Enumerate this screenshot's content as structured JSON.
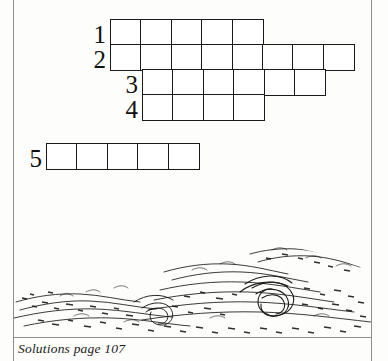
{
  "page": {
    "background_color": "#fdfdfb",
    "rule_color": "#8e8e8e",
    "ink_color": "#1a1a1a"
  },
  "puzzle": {
    "name": "staircase-crossword-grid",
    "cell_width": 32,
    "cell_height": 27,
    "rows": [
      {
        "number": "1",
        "cells": 5,
        "left": 110,
        "top": 19,
        "num_left": 82,
        "num_top": 22
      },
      {
        "number": "2",
        "cells": 8,
        "left": 110,
        "top": 44,
        "num_left": 82,
        "num_top": 47
      },
      {
        "number": "3",
        "cells": 6,
        "left": 142,
        "top": 69,
        "num_left": 114,
        "num_top": 72
      },
      {
        "number": "4",
        "cells": 4,
        "left": 142,
        "top": 94,
        "num_left": 114,
        "num_top": 97
      },
      {
        "number": "5",
        "cells": 5,
        "left": 46,
        "top": 143,
        "num_left": 18,
        "num_top": 146
      }
    ]
  },
  "illustration": {
    "name": "stormy-sea-waves",
    "description": "pen and ink drawing of breaking ocean waves"
  },
  "caption": {
    "text": "Solutions page 107"
  }
}
